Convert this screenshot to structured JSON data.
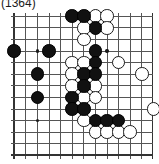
{
  "figure": {
    "caption": "(1364)",
    "type": "go-board-diagram",
    "colors": {
      "black_stone": "#111111",
      "white_stone": "#ffffff",
      "stone_outline": "#1a1a1a",
      "grid_line": "#555555",
      "border_line": "#333333",
      "background": "#ffffff"
    }
  },
  "board": {
    "columns": 13,
    "rows": 13,
    "cell_px": 11.6,
    "stone_diameter_px": 13.5,
    "hoshi_points": [
      {
        "col": 2,
        "row": 3
      },
      {
        "col": 8,
        "row": 3
      },
      {
        "col": 2,
        "row": 9
      },
      {
        "col": 8,
        "row": 9
      }
    ],
    "edges": {
      "left": "thick",
      "right": "thick",
      "top": "thin",
      "bottom": "thick"
    },
    "black_stones": [
      {
        "col": 5,
        "row": 0
      },
      {
        "col": 6,
        "row": 0
      },
      {
        "col": 7,
        "row": 1
      },
      {
        "col": 0,
        "row": 3
      },
      {
        "col": 3,
        "row": 3
      },
      {
        "col": 7,
        "row": 3
      },
      {
        "col": 7,
        "row": 4
      },
      {
        "col": 2,
        "row": 5
      },
      {
        "col": 6,
        "row": 5
      },
      {
        "col": 7,
        "row": 5
      },
      {
        "col": 6,
        "row": 6
      },
      {
        "col": 2,
        "row": 7
      },
      {
        "col": 5,
        "row": 7
      },
      {
        "col": 5,
        "row": 8
      },
      {
        "col": 6,
        "row": 8
      },
      {
        "col": 7,
        "row": 9
      },
      {
        "col": 8,
        "row": 9
      },
      {
        "col": 9,
        "row": 9
      }
    ],
    "white_stones": [
      {
        "col": 7,
        "row": 0
      },
      {
        "col": 8,
        "row": 0
      },
      {
        "col": 6,
        "row": 1
      },
      {
        "col": 8,
        "row": 1
      },
      {
        "col": 6,
        "row": 2
      },
      {
        "col": 5,
        "row": 4
      },
      {
        "col": 6,
        "row": 4
      },
      {
        "col": 9,
        "row": 4
      },
      {
        "col": 5,
        "row": 5
      },
      {
        "col": 11,
        "row": 5
      },
      {
        "col": 5,
        "row": 6
      },
      {
        "col": 7,
        "row": 6
      },
      {
        "col": 6,
        "row": 7
      },
      {
        "col": 7,
        "row": 7
      },
      {
        "col": 12,
        "row": 8
      },
      {
        "col": 6,
        "row": 9
      },
      {
        "col": 7,
        "row": 10
      },
      {
        "col": 8,
        "row": 10
      },
      {
        "col": 9,
        "row": 10
      },
      {
        "col": 10,
        "row": 10
      }
    ]
  }
}
